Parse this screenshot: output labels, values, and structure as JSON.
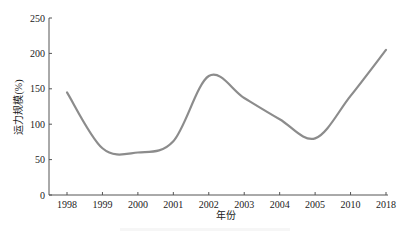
{
  "chart_data": {
    "type": "line",
    "title": "",
    "xlabel": "年份",
    "ylabel": "运力规模(%)",
    "categories": [
      "1998",
      "1999",
      "2000",
      "2001",
      "2002",
      "2003",
      "2004",
      "2005",
      "2010",
      "2018"
    ],
    "series": [
      {
        "name": "运力规模",
        "values": [
          145,
          66,
          60,
          76,
          168,
          137,
          107,
          80,
          140,
          205
        ],
        "color": "#8c8c8c"
      }
    ],
    "yticks": [
      0,
      50,
      100,
      150,
      200,
      250
    ],
    "ylim": [
      0,
      250
    ],
    "grid": false,
    "legend": "none"
  }
}
